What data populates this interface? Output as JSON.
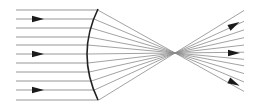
{
  "diagram": {
    "type": "ray-diagram",
    "colors": {
      "ray": "#8a8a8a",
      "lens": "#222222",
      "arrow": "#1a1a1a",
      "background": "#ffffff"
    },
    "incoming_rays": {
      "x_start": 16,
      "count": 11,
      "y": [
        10,
        19,
        28,
        37,
        45,
        54,
        63,
        72,
        81,
        90,
        100
      ]
    },
    "lens": {
      "top": [
        98,
        9
      ],
      "apex": [
        87,
        54
      ],
      "bottom": [
        98,
        100
      ]
    },
    "focal_point": [
      175,
      53
    ],
    "outgoing_end_x": 244,
    "arrows_in": [
      [
        40,
        19
      ],
      [
        40,
        54
      ],
      [
        40,
        90
      ]
    ],
    "arrows_out": [
      [
        236,
        24,
        -0.55
      ],
      [
        236,
        53,
        0
      ],
      [
        236,
        84,
        0.5
      ]
    ]
  }
}
